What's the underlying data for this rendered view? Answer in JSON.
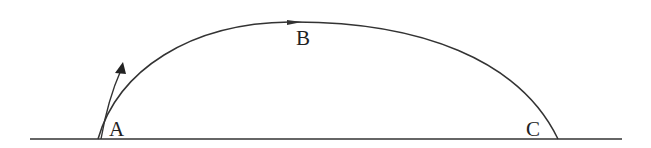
{
  "diagram": {
    "type": "projectile-trajectory",
    "labels": {
      "a": "A",
      "b": "B",
      "c": "C"
    },
    "colors": {
      "stroke": "#333333",
      "background": "#ffffff"
    },
    "elements": [
      "ground-line",
      "trajectory-arc-A-to-C",
      "launch-velocity-arrow-at-A",
      "direction-arrow-at-B"
    ]
  }
}
